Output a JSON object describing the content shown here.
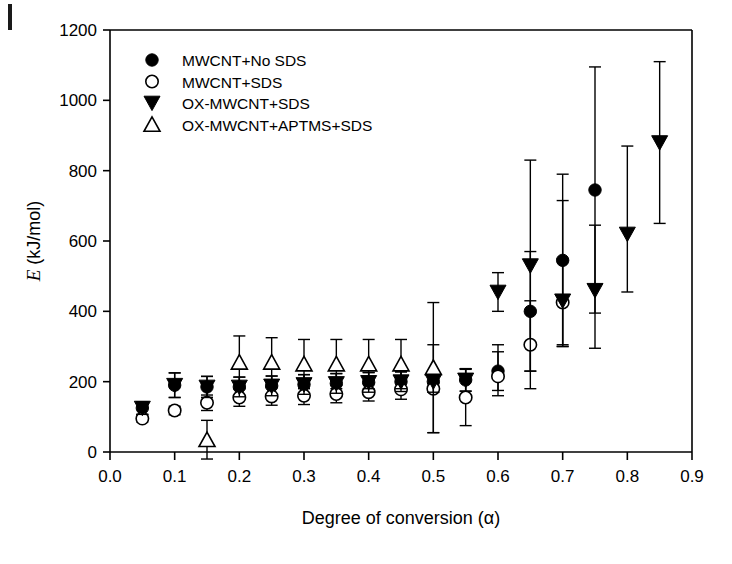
{
  "figure": {
    "corner_artifact": true
  },
  "chart_data": {
    "type": "scatter",
    "title": "",
    "xlabel": "Degree of conversion (α)",
    "ylabel": "E (kJ/mol)",
    "ylabel_italic_part": "E",
    "ylabel_rest": " (kJ/mol)",
    "xlim": [
      0.0,
      0.9
    ],
    "ylim": [
      0,
      1200
    ],
    "xticks": [
      0.0,
      0.1,
      0.2,
      0.3,
      0.4,
      0.5,
      0.6,
      0.7,
      0.8,
      0.9
    ],
    "xticklabels": [
      "0.0",
      "0.1",
      "0.2",
      "0.3",
      "0.4",
      "0.5",
      "0.6",
      "0.7",
      "0.8",
      "0.9"
    ],
    "yticks": [
      0,
      200,
      400,
      600,
      800,
      1000,
      1200
    ],
    "yticklabels": [
      "0",
      "200",
      "400",
      "600",
      "800",
      "1000",
      "1200"
    ],
    "grid": false,
    "legend_position": "upper left",
    "errorbars": true,
    "series": [
      {
        "name": "MWCNT+No SDS",
        "marker": "filled-circle",
        "color": "#000000",
        "x": [
          0.05,
          0.1,
          0.15,
          0.2,
          0.25,
          0.3,
          0.35,
          0.4,
          0.45,
          0.5,
          0.55,
          0.6,
          0.65,
          0.7,
          0.75
        ],
        "values": [
          125,
          190,
          185,
          185,
          188,
          192,
          195,
          198,
          200,
          200,
          205,
          230,
          400,
          545,
          745
        ],
        "err_low": [
          18,
          35,
          30,
          28,
          28,
          28,
          28,
          28,
          28,
          30,
          32,
          55,
          170,
          245,
          350
        ],
        "err_high": [
          18,
          35,
          30,
          28,
          28,
          28,
          28,
          28,
          28,
          30,
          32,
          55,
          170,
          245,
          350
        ]
      },
      {
        "name": "MWCNT+SDS",
        "marker": "open-circle",
        "color": "#000000",
        "x": [
          0.05,
          0.1,
          0.15,
          0.2,
          0.25,
          0.3,
          0.35,
          0.4,
          0.45,
          0.5,
          0.55,
          0.6,
          0.65,
          0.7
        ],
        "values": [
          95,
          118,
          140,
          155,
          158,
          160,
          165,
          170,
          178,
          180,
          155,
          215,
          305,
          425
        ],
        "err_low": [
          10,
          12,
          22,
          25,
          25,
          25,
          25,
          25,
          28,
          125,
          80,
          55,
          125,
          125
        ],
        "err_high": [
          10,
          12,
          22,
          25,
          25,
          25,
          25,
          25,
          28,
          125,
          80,
          90,
          125,
          125
        ]
      },
      {
        "name": "OX-MWCNT+SDS",
        "marker": "filled-triangle-down",
        "color": "#000000",
        "x": [
          0.05,
          0.1,
          0.15,
          0.2,
          0.25,
          0.3,
          0.35,
          0.4,
          0.45,
          0.5,
          0.55,
          0.6,
          0.65,
          0.7,
          0.75,
          0.8,
          0.85
        ],
        "values": [
          125,
          190,
          185,
          185,
          188,
          192,
          195,
          198,
          200,
          200,
          205,
          455,
          530,
          430,
          460,
          620,
          880
        ],
        "err_low": [
          18,
          35,
          30,
          28,
          28,
          28,
          28,
          28,
          28,
          30,
          32,
          55,
          300,
          125,
          165,
          165,
          230
        ],
        "err_high": [
          18,
          35,
          30,
          28,
          28,
          28,
          28,
          28,
          28,
          30,
          32,
          55,
          300,
          285,
          185,
          250,
          230
        ]
      },
      {
        "name": "OX-MWCNT+APTMS+SDS",
        "marker": "open-triangle-up",
        "color": "#000000",
        "x": [
          0.15,
          0.2,
          0.25,
          0.3,
          0.35,
          0.4,
          0.45,
          0.5
        ],
        "values": [
          35,
          255,
          255,
          250,
          250,
          250,
          250,
          240
        ],
        "err_low": [
          55,
          75,
          70,
          70,
          70,
          70,
          70,
          185
        ],
        "err_high": [
          55,
          75,
          70,
          70,
          70,
          70,
          70,
          185
        ]
      }
    ]
  },
  "legend": {
    "items": [
      {
        "label": "MWCNT+No SDS",
        "marker": "filled-circle"
      },
      {
        "label": "MWCNT+SDS",
        "marker": "open-circle"
      },
      {
        "label": "OX-MWCNT+SDS",
        "marker": "filled-triangle-down"
      },
      {
        "label": "OX-MWCNT+APTMS+SDS",
        "marker": "open-triangle-up"
      }
    ]
  }
}
